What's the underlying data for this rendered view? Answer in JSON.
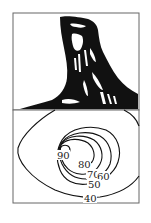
{
  "figure": {
    "panels": [
      {
        "id": "sketch",
        "description": "ink sketch of a steep rock pillar / peak"
      },
      {
        "id": "contour-map",
        "description": "contour lines of the same landform"
      }
    ],
    "colors": {
      "ink": "#111111",
      "frame": "#555555",
      "background": "#ffffff"
    }
  },
  "contours": {
    "labels": [
      {
        "value": "90",
        "x": 58,
        "y": 158
      },
      {
        "value": "80",
        "x": 79,
        "y": 167
      },
      {
        "value": "70",
        "x": 88,
        "y": 177
      },
      {
        "value": "60",
        "x": 98,
        "y": 179
      },
      {
        "value": "50",
        "x": 89,
        "y": 187
      },
      {
        "value": "40",
        "x": 85,
        "y": 201
      }
    ]
  }
}
